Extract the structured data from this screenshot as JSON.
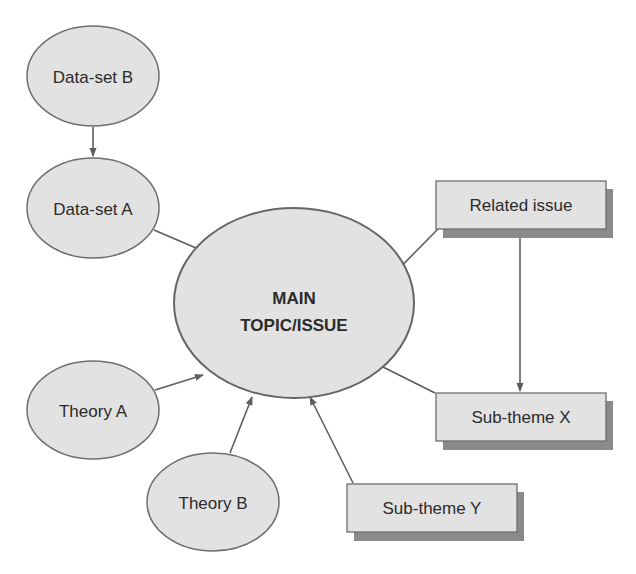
{
  "diagram": {
    "type": "concept-map",
    "colors": {
      "background": "#ffffff",
      "node_fill": "#e2e2e2",
      "node_stroke": "#6e6e6e",
      "shadow": "#8a8a8a",
      "edge": "#5e5e5e",
      "text": "#2b2b2b"
    },
    "nodes": {
      "dataset_b": {
        "label": "Data-set B",
        "shape": "ellipse"
      },
      "dataset_a": {
        "label": "Data-set A",
        "shape": "ellipse"
      },
      "main": {
        "label_line1": "MAIN",
        "label_line2": "TOPIC/ISSUE",
        "shape": "ellipse"
      },
      "theory_a": {
        "label": "Theory A",
        "shape": "ellipse"
      },
      "theory_b": {
        "label": "Theory B",
        "shape": "ellipse"
      },
      "related_issue": {
        "label": "Related issue",
        "shape": "box"
      },
      "subtheme_x": {
        "label": "Sub-theme X",
        "shape": "box"
      },
      "subtheme_y": {
        "label": "Sub-theme Y",
        "shape": "box"
      }
    },
    "edges": [
      {
        "from": "Data-set B",
        "to": "Data-set A"
      },
      {
        "from": "Data-set A",
        "to": "MAIN TOPIC/ISSUE"
      },
      {
        "from": "Related issue",
        "to": "MAIN TOPIC/ISSUE"
      },
      {
        "from": "Related issue",
        "to": "Sub-theme X"
      },
      {
        "from": "Sub-theme X",
        "to": "MAIN TOPIC/ISSUE"
      },
      {
        "from": "Theory A",
        "to": "MAIN TOPIC/ISSUE"
      },
      {
        "from": "Theory B",
        "to": "MAIN TOPIC/ISSUE"
      },
      {
        "from": "Sub-theme Y",
        "to": "MAIN TOPIC/ISSUE"
      }
    ]
  }
}
